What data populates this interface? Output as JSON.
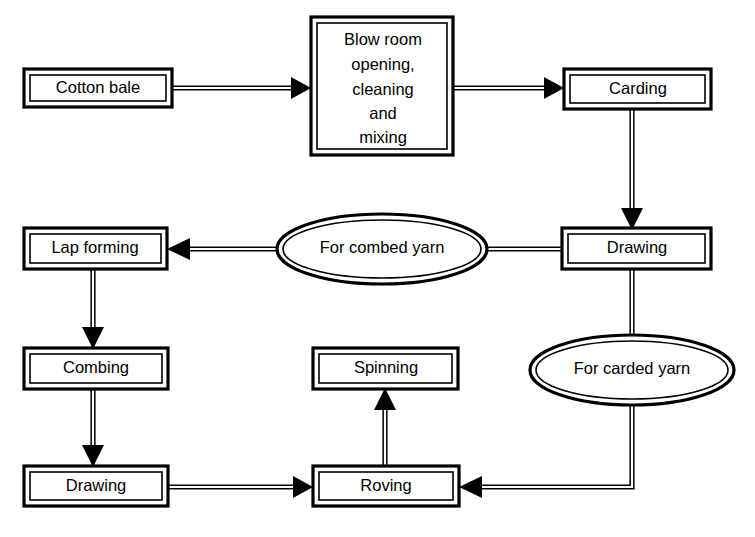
{
  "diagram": {
    "background_color": "#ffffff",
    "line_color": "#000000",
    "nodes": [
      {
        "id": "cotton-bale",
        "shape": "rectangle",
        "label": "Cotton bale",
        "lines": [
          "Cotton bale"
        ],
        "x": 24,
        "y": 69,
        "w": 148,
        "h": 38
      },
      {
        "id": "blow-room",
        "shape": "rectangle",
        "label": "Blow room opening, cleaning and mixing",
        "lines": [
          "Blow room",
          "opening,",
          "cleaning",
          "and",
          "mixing"
        ],
        "x": 311,
        "y": 17,
        "w": 142,
        "h": 138
      },
      {
        "id": "carding",
        "shape": "rectangle",
        "label": "Carding",
        "lines": [
          "Carding"
        ],
        "x": 564,
        "y": 69,
        "w": 147,
        "h": 40
      },
      {
        "id": "drawing-right",
        "shape": "rectangle",
        "label": "Drawing",
        "lines": [
          "Drawing"
        ],
        "x": 562,
        "y": 228,
        "w": 149,
        "h": 41
      },
      {
        "id": "for-combed-yarn",
        "shape": "ellipse",
        "label": "For combed yarn",
        "lines": [
          "For combed yarn"
        ],
        "cx": 382,
        "cy": 249,
        "rx": 105,
        "ry": 35
      },
      {
        "id": "lap-forming",
        "shape": "rectangle",
        "label": "Lap forming",
        "lines": [
          "Lap forming"
        ],
        "x": 24,
        "y": 228,
        "w": 143,
        "h": 41
      },
      {
        "id": "combing",
        "shape": "rectangle",
        "label": "Combing",
        "lines": [
          "Combing"
        ],
        "x": 24,
        "y": 348,
        "w": 144,
        "h": 41
      },
      {
        "id": "drawing-left",
        "shape": "rectangle",
        "label": "Drawing",
        "lines": [
          "Drawing"
        ],
        "x": 24,
        "y": 466,
        "w": 144,
        "h": 40
      },
      {
        "id": "spinning",
        "shape": "rectangle",
        "label": "Spinning",
        "lines": [
          "Spinning"
        ],
        "x": 313,
        "y": 348,
        "w": 145,
        "h": 41
      },
      {
        "id": "roving",
        "shape": "rectangle",
        "label": "Roving",
        "lines": [
          "Roving"
        ],
        "x": 313,
        "y": 466,
        "w": 146,
        "h": 40
      },
      {
        "id": "for-carded-yarn",
        "shape": "ellipse",
        "label": "For carded yarn",
        "lines": [
          "For carded yarn"
        ],
        "cx": 632,
        "cy": 370,
        "rx": 102,
        "ry": 35
      }
    ],
    "edges": [
      {
        "id": "e1",
        "from": "cotton-bale",
        "to": "blow-room",
        "arrow": true
      },
      {
        "id": "e2",
        "from": "blow-room",
        "to": "carding",
        "arrow": true
      },
      {
        "id": "e3",
        "from": "carding",
        "to": "drawing-right",
        "arrow": true
      },
      {
        "id": "e4",
        "from": "drawing-right",
        "to": "for-combed-yarn",
        "arrow": false
      },
      {
        "id": "e5",
        "from": "for-combed-yarn",
        "to": "lap-forming",
        "arrow": true
      },
      {
        "id": "e6",
        "from": "lap-forming",
        "to": "combing",
        "arrow": true
      },
      {
        "id": "e7",
        "from": "combing",
        "to": "drawing-left",
        "arrow": true
      },
      {
        "id": "e8",
        "from": "drawing-left",
        "to": "roving",
        "arrow": true
      },
      {
        "id": "e9",
        "from": "roving",
        "to": "spinning",
        "arrow": true
      },
      {
        "id": "e10",
        "from": "drawing-right",
        "to": "for-carded-yarn",
        "arrow": false
      },
      {
        "id": "e11",
        "from": "for-carded-yarn",
        "to": "roving",
        "arrow": true
      }
    ]
  }
}
